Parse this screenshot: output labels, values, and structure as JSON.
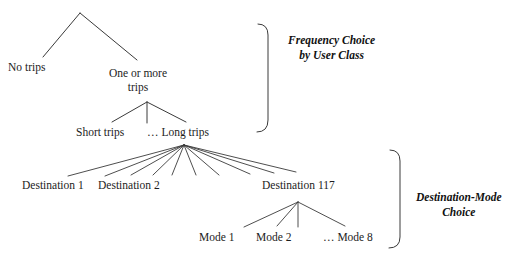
{
  "diagram": {
    "title_hidden": "",
    "nodes": {
      "root": {
        "label": ""
      },
      "no_trips": {
        "label": "No trips",
        "x": 8,
        "y": 61
      },
      "one_or_more": {
        "line1": "One or more",
        "line2": "trips",
        "x": 104,
        "y": 66
      },
      "short_trips": {
        "label": "Short trips",
        "x": 76,
        "y": 126
      },
      "long_trips": {
        "label": "… Long trips",
        "x": 147,
        "y": 126
      },
      "destination_1": {
        "label": "Destination 1",
        "x": 22,
        "y": 179
      },
      "destination_2": {
        "label": "Destination 2",
        "x": 98,
        "y": 179
      },
      "destination_117": {
        "label": "Destination 117",
        "x": 262,
        "y": 179
      },
      "mode_1": {
        "label": "Mode 1",
        "x": 199,
        "y": 231
      },
      "mode_2": {
        "label": "Mode 2",
        "x": 256,
        "y": 231
      },
      "mode_8": {
        "label": "… Mode 8",
        "x": 323,
        "y": 231
      }
    },
    "brackets": [
      {
        "id": "frequency-choice-bracket",
        "line1": "Frequency Choice",
        "line2": "by User Class",
        "label_x": 288,
        "label_y": 33
      },
      {
        "id": "destination-mode-choice-bracket",
        "line1": "Destination-Mode",
        "line2": "Choice",
        "label_x": 416,
        "label_y": 190
      }
    ],
    "colors": {
      "stroke": "#3a3a3a",
      "text": "#1c1c1c",
      "background": "#ffffff"
    }
  }
}
